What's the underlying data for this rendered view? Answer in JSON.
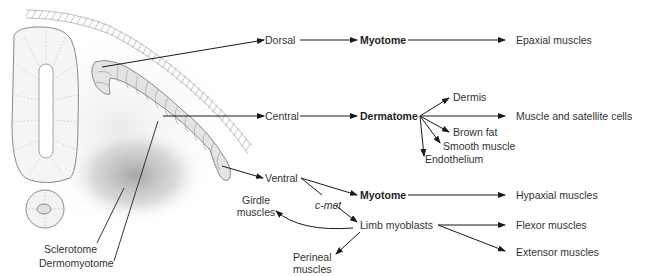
{
  "anatomy_labels": {
    "sclerotome": "Sclerotome",
    "dermomyotome": "Dermomyotome"
  },
  "regions": {
    "dorsal": "Dorsal",
    "central": "Central",
    "ventral": "Ventral"
  },
  "dorsal_branch": {
    "structure": "Myotome",
    "output": "Epaxial muscles"
  },
  "central_branch": {
    "structure": "Dermatome",
    "outputs": [
      "Dermis",
      "Muscle and satellite cells",
      "Brown fat",
      "Smooth muscle",
      "Endothelium"
    ]
  },
  "ventral_branch": {
    "signal": "c-met",
    "structure": "Myotome",
    "structure_output": "Hypaxial muscles",
    "limb": "Limb myoblasts",
    "limb_outputs": [
      "Flexor muscles",
      "Extensor muscles"
    ],
    "girdle_line1": "Girdle",
    "girdle_line2": "muscles",
    "perineal_line1": "Perineal",
    "perineal_line2": "muscles"
  },
  "colors": {
    "arrow": "#1a1a1a",
    "outline": "#8a8a8a",
    "shade": "#bdbdbd",
    "text": "#333333"
  }
}
